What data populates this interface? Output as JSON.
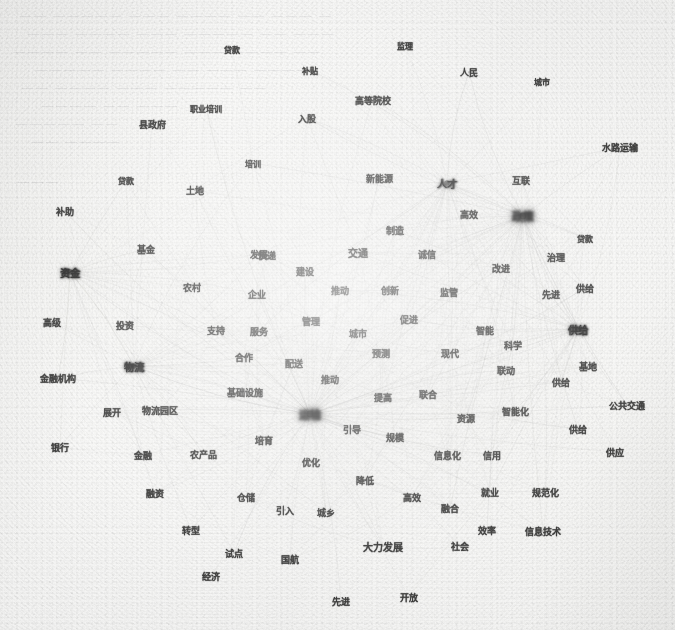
{
  "figure": {
    "type": "network-graph",
    "medium": "scanned-paper",
    "background_color": "#f7f7f5",
    "node_color": "#20201f",
    "edge_color": "#9a9a9a",
    "width": 675,
    "height": 630
  },
  "ghost_text": [
    {
      "text": "— ——— —— ———— ——— ————— ——",
      "x": 18,
      "y": 8
    },
    {
      "text": "——— —— ————— ——— ———— ———",
      "x": 26,
      "y": 26
    },
    {
      "text": "—— ———— ——— ————— —— ————",
      "x": 12,
      "y": 44
    },
    {
      "text": "———— ——— —— ———— —————",
      "x": 34,
      "y": 62
    },
    {
      "text": "—— ————— ——— ———— ——",
      "x": 20,
      "y": 80
    },
    {
      "text": "——— —— ————",
      "x": 40,
      "y": 98
    },
    {
      "text": "—— —————",
      "x": 14,
      "y": 116
    },
    {
      "text": "———— ——",
      "x": 30,
      "y": 134
    },
    {
      "text": "———",
      "x": 16,
      "y": 174
    }
  ],
  "chart_data": {
    "type": "network",
    "title": "",
    "xlabel": "",
    "ylabel": "",
    "legend": [],
    "nodes": [
      {
        "label": "贷款",
        "x": 232,
        "y": 49,
        "size": 8,
        "weight": "normal"
      },
      {
        "label": "监理",
        "x": 405,
        "y": 45,
        "size": 8,
        "weight": "normal"
      },
      {
        "label": "补贴",
        "x": 310,
        "y": 70,
        "size": 8,
        "weight": "normal"
      },
      {
        "label": "人民",
        "x": 469,
        "y": 72,
        "size": 9,
        "weight": "normal"
      },
      {
        "label": "城市",
        "x": 542,
        "y": 81,
        "size": 8,
        "weight": "normal"
      },
      {
        "label": "职业培训",
        "x": 206,
        "y": 108,
        "size": 8,
        "weight": "normal"
      },
      {
        "label": "高等院校",
        "x": 373,
        "y": 100,
        "size": 9,
        "weight": "normal"
      },
      {
        "label": "县政府",
        "x": 152,
        "y": 124,
        "size": 9,
        "weight": "normal"
      },
      {
        "label": "入股",
        "x": 307,
        "y": 118,
        "size": 9,
        "weight": "normal"
      },
      {
        "label": "水路运输",
        "x": 620,
        "y": 147,
        "size": 9,
        "weight": "normal"
      },
      {
        "label": "培训",
        "x": 253,
        "y": 163,
        "size": 8,
        "weight": "normal"
      },
      {
        "label": "新能源",
        "x": 379,
        "y": 178,
        "size": 9,
        "weight": "normal"
      },
      {
        "label": "互联",
        "x": 521,
        "y": 180,
        "size": 9,
        "weight": "normal"
      },
      {
        "label": "贷款",
        "x": 126,
        "y": 180,
        "size": 8,
        "weight": "normal"
      },
      {
        "label": "土地",
        "x": 195,
        "y": 190,
        "size": 9,
        "weight": "normal"
      },
      {
        "label": "人才",
        "x": 447,
        "y": 183,
        "size": 10,
        "weight": "hub"
      },
      {
        "label": "补助",
        "x": 65,
        "y": 211,
        "size": 9,
        "weight": "normal"
      },
      {
        "label": "高效",
        "x": 469,
        "y": 214,
        "size": 9,
        "weight": "normal"
      },
      {
        "label": "政策",
        "x": 523,
        "y": 216,
        "size": 11,
        "weight": "superhub"
      },
      {
        "label": "贷款",
        "x": 585,
        "y": 238,
        "size": 8,
        "weight": "normal"
      },
      {
        "label": "基金",
        "x": 146,
        "y": 249,
        "size": 9,
        "weight": "normal"
      },
      {
        "label": "发展",
        "x": 259,
        "y": 254,
        "size": 9,
        "weight": "normal"
      },
      {
        "label": "交通",
        "x": 358,
        "y": 252,
        "size": 10,
        "weight": "normal"
      },
      {
        "label": "制造",
        "x": 395,
        "y": 230,
        "size": 9,
        "weight": "normal"
      },
      {
        "label": "诚信",
        "x": 427,
        "y": 254,
        "size": 9,
        "weight": "normal"
      },
      {
        "label": "治理",
        "x": 556,
        "y": 257,
        "size": 9,
        "weight": "normal"
      },
      {
        "label": "快递",
        "x": 267,
        "y": 255,
        "size": 9,
        "weight": "normal"
      },
      {
        "label": "改进",
        "x": 501,
        "y": 268,
        "size": 9,
        "weight": "normal"
      },
      {
        "label": "资金",
        "x": 70,
        "y": 272,
        "size": 10,
        "weight": "hub"
      },
      {
        "label": "农村",
        "x": 192,
        "y": 287,
        "size": 9,
        "weight": "normal"
      },
      {
        "label": "建设",
        "x": 305,
        "y": 271,
        "size": 9,
        "weight": "normal"
      },
      {
        "label": "企业",
        "x": 257,
        "y": 294,
        "size": 9,
        "weight": "normal"
      },
      {
        "label": "推动",
        "x": 340,
        "y": 290,
        "size": 9,
        "weight": "normal"
      },
      {
        "label": "创新",
        "x": 390,
        "y": 290,
        "size": 9,
        "weight": "normal"
      },
      {
        "label": "监管",
        "x": 449,
        "y": 292,
        "size": 9,
        "weight": "normal"
      },
      {
        "label": "先进",
        "x": 551,
        "y": 294,
        "size": 9,
        "weight": "normal"
      },
      {
        "label": "供给",
        "x": 585,
        "y": 288,
        "size": 9,
        "weight": "normal"
      },
      {
        "label": "高级",
        "x": 52,
        "y": 322,
        "size": 9,
        "weight": "normal"
      },
      {
        "label": "投资",
        "x": 125,
        "y": 325,
        "size": 9,
        "weight": "normal"
      },
      {
        "label": "支持",
        "x": 216,
        "y": 330,
        "size": 9,
        "weight": "normal"
      },
      {
        "label": "服务",
        "x": 259,
        "y": 331,
        "size": 9,
        "weight": "normal"
      },
      {
        "label": "管理",
        "x": 311,
        "y": 321,
        "size": 9,
        "weight": "normal"
      },
      {
        "label": "城市",
        "x": 358,
        "y": 333,
        "size": 9,
        "weight": "normal"
      },
      {
        "label": "促进",
        "x": 409,
        "y": 319,
        "size": 9,
        "weight": "normal"
      },
      {
        "label": "智能",
        "x": 485,
        "y": 330,
        "size": 9,
        "weight": "normal"
      },
      {
        "label": "科学",
        "x": 513,
        "y": 345,
        "size": 9,
        "weight": "normal"
      },
      {
        "label": "供给",
        "x": 578,
        "y": 329,
        "size": 10,
        "weight": "hub"
      },
      {
        "label": "金融机构",
        "x": 58,
        "y": 378,
        "size": 9,
        "weight": "normal"
      },
      {
        "label": "物流",
        "x": 134,
        "y": 366,
        "size": 10,
        "weight": "hub"
      },
      {
        "label": "合作",
        "x": 244,
        "y": 357,
        "size": 9,
        "weight": "normal"
      },
      {
        "label": "配送",
        "x": 294,
        "y": 363,
        "size": 9,
        "weight": "normal"
      },
      {
        "label": "预测",
        "x": 381,
        "y": 353,
        "size": 9,
        "weight": "normal"
      },
      {
        "label": "现代",
        "x": 450,
        "y": 353,
        "size": 9,
        "weight": "normal"
      },
      {
        "label": "联动",
        "x": 506,
        "y": 370,
        "size": 9,
        "weight": "normal"
      },
      {
        "label": "基地",
        "x": 588,
        "y": 366,
        "size": 9,
        "weight": "normal"
      },
      {
        "label": "推动",
        "x": 330,
        "y": 379,
        "size": 9,
        "weight": "normal"
      },
      {
        "label": "供给",
        "x": 561,
        "y": 382,
        "size": 9,
        "weight": "normal"
      },
      {
        "label": "展开",
        "x": 112,
        "y": 412,
        "size": 9,
        "weight": "normal"
      },
      {
        "label": "物流园区",
        "x": 160,
        "y": 410,
        "size": 9,
        "weight": "normal"
      },
      {
        "label": "基础设施",
        "x": 245,
        "y": 392,
        "size": 9,
        "weight": "normal"
      },
      {
        "label": "提高",
        "x": 383,
        "y": 397,
        "size": 9,
        "weight": "normal"
      },
      {
        "label": "联合",
        "x": 428,
        "y": 394,
        "size": 9,
        "weight": "normal"
      },
      {
        "label": "资源",
        "x": 466,
        "y": 418,
        "size": 9,
        "weight": "normal"
      },
      {
        "label": "智能化",
        "x": 515,
        "y": 411,
        "size": 9,
        "weight": "normal"
      },
      {
        "label": "公共交通",
        "x": 627,
        "y": 405,
        "size": 9,
        "weight": "normal"
      },
      {
        "label": "运输",
        "x": 310,
        "y": 414,
        "size": 11,
        "weight": "superhub"
      },
      {
        "label": "引导",
        "x": 352,
        "y": 429,
        "size": 9,
        "weight": "normal"
      },
      {
        "label": "规模",
        "x": 395,
        "y": 437,
        "size": 9,
        "weight": "normal"
      },
      {
        "label": "供给",
        "x": 578,
        "y": 429,
        "size": 9,
        "weight": "normal"
      },
      {
        "label": "培育",
        "x": 264,
        "y": 440,
        "size": 9,
        "weight": "normal"
      },
      {
        "label": "银行",
        "x": 60,
        "y": 447,
        "size": 9,
        "weight": "normal"
      },
      {
        "label": "金融",
        "x": 143,
        "y": 455,
        "size": 9,
        "weight": "normal"
      },
      {
        "label": "农产品",
        "x": 203,
        "y": 454,
        "size": 9,
        "weight": "normal"
      },
      {
        "label": "信息化",
        "x": 447,
        "y": 455,
        "size": 9,
        "weight": "normal"
      },
      {
        "label": "信用",
        "x": 492,
        "y": 455,
        "size": 9,
        "weight": "normal"
      },
      {
        "label": "供应",
        "x": 615,
        "y": 452,
        "size": 9,
        "weight": "normal"
      },
      {
        "label": "优化",
        "x": 311,
        "y": 462,
        "size": 9,
        "weight": "normal"
      },
      {
        "label": "降低",
        "x": 365,
        "y": 480,
        "size": 9,
        "weight": "normal"
      },
      {
        "label": "融资",
        "x": 155,
        "y": 493,
        "size": 9,
        "weight": "normal"
      },
      {
        "label": "仓储",
        "x": 246,
        "y": 497,
        "size": 9,
        "weight": "normal"
      },
      {
        "label": "高效",
        "x": 412,
        "y": 497,
        "size": 9,
        "weight": "normal"
      },
      {
        "label": "融合",
        "x": 450,
        "y": 508,
        "size": 9,
        "weight": "normal"
      },
      {
        "label": "就业",
        "x": 490,
        "y": 492,
        "size": 9,
        "weight": "normal"
      },
      {
        "label": "规范化",
        "x": 545,
        "y": 492,
        "size": 9,
        "weight": "normal"
      },
      {
        "label": "引入",
        "x": 285,
        "y": 510,
        "size": 9,
        "weight": "normal"
      },
      {
        "label": "城乡",
        "x": 326,
        "y": 512,
        "size": 9,
        "weight": "normal"
      },
      {
        "label": "转型",
        "x": 191,
        "y": 530,
        "size": 9,
        "weight": "normal"
      },
      {
        "label": "效率",
        "x": 487,
        "y": 530,
        "size": 9,
        "weight": "normal"
      },
      {
        "label": "信息技术",
        "x": 543,
        "y": 531,
        "size": 9,
        "weight": "normal"
      },
      {
        "label": "大力发展",
        "x": 383,
        "y": 546,
        "size": 10,
        "weight": "normal"
      },
      {
        "label": "社会",
        "x": 460,
        "y": 546,
        "size": 9,
        "weight": "normal"
      },
      {
        "label": "试点",
        "x": 234,
        "y": 553,
        "size": 9,
        "weight": "normal"
      },
      {
        "label": "国航",
        "x": 290,
        "y": 559,
        "size": 9,
        "weight": "normal"
      },
      {
        "label": "经济",
        "x": 211,
        "y": 576,
        "size": 9,
        "weight": "normal"
      },
      {
        "label": "先进",
        "x": 341,
        "y": 601,
        "size": 9,
        "weight": "normal"
      },
      {
        "label": "开放",
        "x": 409,
        "y": 597,
        "size": 9,
        "weight": "normal"
      }
    ],
    "hub_nodes": [
      "人才",
      "政策",
      "资金",
      "供给",
      "物流",
      "运输"
    ],
    "edge_count_estimate": 900
  }
}
